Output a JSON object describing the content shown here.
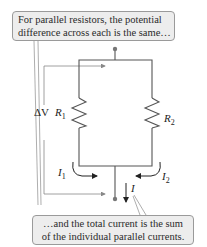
{
  "callouts": {
    "top": {
      "line1": "For parallel resistors, the potential",
      "line2": "difference across each is the same…"
    },
    "bottom": {
      "line1": "…and the total current is the sum",
      "line2": "of the individual parallel currents."
    }
  },
  "labels": {
    "delta_v": "ΔV",
    "r1": {
      "main": "R",
      "sub": "1"
    },
    "r2": {
      "main": "R",
      "sub": "2"
    },
    "i1": {
      "main": "I",
      "sub": "1"
    },
    "i2": {
      "main": "I",
      "sub": "2"
    },
    "i_total": "I"
  },
  "colors": {
    "wire": "#555555",
    "callout_bg": "#ededed",
    "callout_border": "#9a9a9a",
    "arrow": "#222222"
  }
}
